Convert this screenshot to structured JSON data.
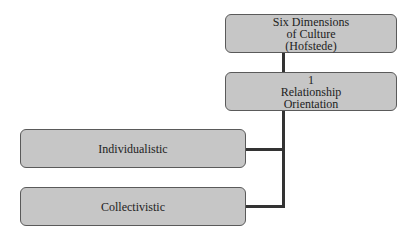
{
  "diagram": {
    "root": {
      "lines": [
        "Six Dimensions",
        "of Culture",
        "(Hofstede)"
      ]
    },
    "dimension": {
      "lines": [
        "1",
        "Relationship",
        "Orientation"
      ]
    },
    "children": [
      {
        "label": "Individualistic"
      },
      {
        "label": "Collectivistic"
      }
    ],
    "colors": {
      "box_fill": "#c6c6c6",
      "box_border": "#5a5a5a",
      "connector": "#333333"
    }
  }
}
